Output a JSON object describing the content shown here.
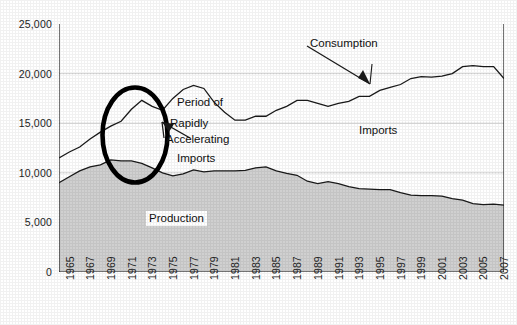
{
  "chart_data": {
    "type": "area",
    "title": "",
    "subtitle": "",
    "xlabel": "",
    "ylabel": "",
    "grid": true,
    "gridlines_at": [
      20000,
      15000,
      10000
    ],
    "legend_position": "inline-annotations",
    "xlim": [
      1965,
      2008
    ],
    "ylim": [
      0,
      25000
    ],
    "ytick_labels": [
      "25,000",
      "20,000",
      "15,000",
      "10,000",
      "5,000",
      "0"
    ],
    "ytick_values": [
      25000,
      20000,
      15000,
      10000,
      5000,
      0
    ],
    "xtick_labels": [
      "1965",
      "1967",
      "1969",
      "1971",
      "1973",
      "1975",
      "1977",
      "1979",
      "1981",
      "1983",
      "1985",
      "1987",
      "1989",
      "1991",
      "1993",
      "1995",
      "1997",
      "1999",
      "2001",
      "2003",
      "2005",
      "2007"
    ],
    "xtick_values": [
      1965,
      1967,
      1969,
      1971,
      1973,
      1975,
      1977,
      1979,
      1981,
      1983,
      1985,
      1987,
      1989,
      1991,
      1993,
      1995,
      1997,
      1999,
      2001,
      2003,
      2005,
      2007
    ],
    "x": [
      1965,
      1966,
      1967,
      1968,
      1969,
      1970,
      1971,
      1972,
      1973,
      1974,
      1975,
      1976,
      1977,
      1978,
      1979,
      1980,
      1981,
      1982,
      1983,
      1984,
      1985,
      1986,
      1987,
      1988,
      1989,
      1990,
      1991,
      1992,
      1993,
      1994,
      1995,
      1996,
      1997,
      1998,
      1999,
      2000,
      2001,
      2002,
      2003,
      2004,
      2005,
      2006,
      2007,
      2008
    ],
    "series": [
      {
        "name": "Consumption",
        "kind": "line",
        "color": "#1a1a1a",
        "values": [
          11500,
          12100,
          12600,
          13400,
          14100,
          14700,
          15200,
          16400,
          17300,
          16700,
          16300,
          17500,
          18400,
          18800,
          18500,
          17100,
          16100,
          15300,
          15300,
          15700,
          15700,
          16300,
          16700,
          17300,
          17300,
          17000,
          16700,
          17000,
          17200,
          17700,
          17700,
          18300,
          18600,
          18900,
          19500,
          19700,
          19650,
          19750,
          20000,
          20700,
          20800,
          20700,
          20700,
          19500
        ]
      },
      {
        "name": "Production",
        "kind": "area",
        "color": "#1a1a1a",
        "fill": "#d0d0d0",
        "values": [
          9000,
          9600,
          10200,
          10600,
          10800,
          11300,
          11200,
          11200,
          10950,
          10500,
          10000,
          9700,
          9900,
          10300,
          10100,
          10200,
          10200,
          10200,
          10250,
          10500,
          10600,
          10200,
          9950,
          9750,
          9150,
          8900,
          9100,
          8900,
          8600,
          8400,
          8350,
          8300,
          8300,
          8000,
          7750,
          7700,
          7700,
          7650,
          7400,
          7250,
          6900,
          6800,
          6850,
          6750
        ]
      }
    ],
    "annotations": [
      {
        "name": "consumption-label",
        "text": "Consumption",
        "arrow": "down-right-to-curve"
      },
      {
        "name": "imports-label",
        "text": "Imports"
      },
      {
        "name": "production-label",
        "text": "Production"
      },
      {
        "name": "period-annotation",
        "lines": [
          "Period of",
          "Rapidly",
          "Accelerating",
          "Imports"
        ],
        "arrow": "left-to-ellipse"
      }
    ],
    "highlight": {
      "name": "ellipse-highlight",
      "shape": "ellipse",
      "x_range": [
        1969,
        1975
      ],
      "y_range": [
        9000,
        18500
      ]
    }
  },
  "labels": {
    "consumption": "Consumption",
    "imports_region": "Imports",
    "production_region": "Production",
    "period_line1": "Period of",
    "period_line2": "Rapidly",
    "period_line3": "Accelerating",
    "period_line4": "Imports"
  },
  "colors": {
    "line": "#1a1a1a",
    "production_fill": "#d0d0d0",
    "grid": "#c8c8c8",
    "axis": "#1a1a1a",
    "highlight_ellipse": "#000000",
    "background": "#ffffff"
  }
}
